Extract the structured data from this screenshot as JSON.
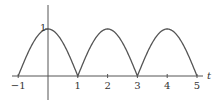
{
  "chart_data": {
    "type": "line",
    "title": "",
    "xlabel": "t",
    "ylabel": "",
    "function": "|cos(pi t / 2)|",
    "xlim": [
      -1,
      5
    ],
    "ylim": [
      0,
      1
    ],
    "x_ticks": [
      "−1",
      "1",
      "2",
      "3",
      "4",
      "5"
    ],
    "y_ticks": [
      "1"
    ],
    "grid": false,
    "series": [
      {
        "name": "curve",
        "x": [
          -1,
          -0.5,
          0,
          0.5,
          1,
          1.5,
          2,
          2.5,
          3,
          3.5,
          4,
          4.5,
          5
        ],
        "values": [
          0,
          0.707,
          1,
          0.707,
          0,
          0.707,
          1,
          0.707,
          0,
          0.707,
          1,
          0.707,
          0
        ]
      }
    ],
    "colors": {
      "axis": "#555555",
      "curve": "#555555"
    }
  }
}
